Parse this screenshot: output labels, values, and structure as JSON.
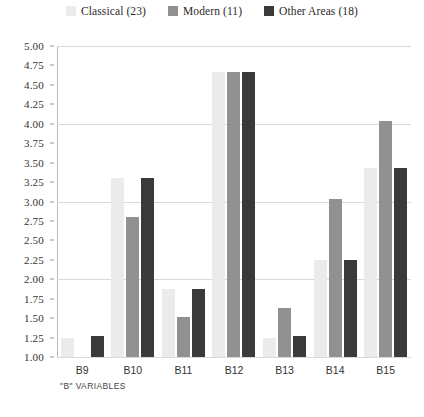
{
  "chart_data": {
    "type": "bar",
    "title": "",
    "subtitle": "",
    "xlabel": "\"B\" VARIABLES",
    "ylabel": "",
    "categories": [
      "B9",
      "B10",
      "B11",
      "B12",
      "B13",
      "B14",
      "B15"
    ],
    "ylim": [
      1.0,
      5.0
    ],
    "ytick_labels": [
      "5.00",
      "4.75",
      "4.50",
      "4.25",
      "4.00",
      "3.75",
      "3.50",
      "3.25",
      "3.00",
      "2.75",
      "2.50",
      "2.25",
      "2.00",
      "1.75",
      "1.50",
      "1.25",
      "1.00"
    ],
    "ytick_values": [
      5.0,
      4.75,
      4.5,
      4.25,
      4.0,
      3.75,
      3.5,
      3.25,
      3.0,
      2.75,
      2.5,
      2.25,
      2.0,
      1.75,
      1.5,
      1.25,
      1.0
    ],
    "gridlines_at": [
      5.0,
      4.0,
      3.0,
      2.0,
      1.0
    ],
    "grid": true,
    "legend_position": "top-center",
    "series": [
      {
        "name": "Classical (23)",
        "color": "#ebebeb",
        "values": [
          1.25,
          3.3,
          1.88,
          4.67,
          1.25,
          2.25,
          3.43
        ]
      },
      {
        "name": "Modern (11)",
        "color": "#919191",
        "values": [
          1.0,
          2.8,
          1.52,
          4.67,
          1.63,
          3.03,
          4.04
        ]
      },
      {
        "name": "Other Areas (18)",
        "color": "#3a3a3a",
        "values": [
          1.27,
          3.3,
          1.88,
          4.67,
          1.27,
          2.25,
          3.43
        ]
      }
    ]
  },
  "legend": {
    "entries": [
      {
        "label": "Classical (23)",
        "color": "#ebebeb"
      },
      {
        "label": "Modern (11)",
        "color": "#919191"
      },
      {
        "label": "Other Areas (18)",
        "color": "#3a3a3a"
      }
    ]
  },
  "axes": {
    "x_title": "\"B\" VARIABLES"
  }
}
